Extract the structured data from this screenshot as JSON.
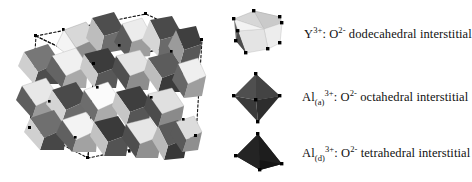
{
  "figure": {
    "background_color": "#ffffff",
    "caption_font_color": "#111111"
  },
  "structure": {
    "name": "garnet-unit-cell-polyhedral-model",
    "description": "Polyhedral model of the garnet unit cell showing interlocking dodecahedra, octahedra and tetrahedra",
    "unit_cell_outline": "dashed",
    "outline_color": "#111111",
    "vertex_marker_color": "#000000",
    "polyhedra_shades": [
      "#ffffff",
      "#e9e9e9",
      "#d2d2d2",
      "#b4b4b4",
      "#949494",
      "#737373",
      "#585858",
      "#3d3d3d"
    ]
  },
  "legend": {
    "items": [
      {
        "icon_name": "dodecahedron-icon",
        "shape": "dodecahedral",
        "cation": "Y",
        "cation_subscript": "",
        "cation_charge": "3+",
        "anion": "O",
        "anion_charge": "2-",
        "separator": ": ",
        "site_text": " dodecahedral interstitial",
        "face_colors": {
          "top_left": "#d5d5d5",
          "top_right": "#c9c9c9",
          "front": "#f2f2f2",
          "front_low": "#e2e2e2",
          "left": "#6e6e6e",
          "left_dark": "#4a4a4a"
        }
      },
      {
        "icon_name": "octahedron-icon",
        "shape": "octahedral",
        "cation": "Al",
        "cation_subscript": "(a)",
        "cation_charge": "3+",
        "anion": "O",
        "anion_charge": "2-",
        "separator": ": ",
        "site_text": " octahedral interstitial",
        "face_colors": {
          "upper_left": "#4f4f4f",
          "upper_right": "#424242",
          "lower_left": "#3a3a3a",
          "lower_right": "#2e2e2e"
        }
      },
      {
        "icon_name": "tetrahedron-icon",
        "shape": "tetrahedral",
        "cation": "Al",
        "cation_subscript": "(d)",
        "cation_charge": "3+",
        "anion": "O",
        "anion_charge": "2-",
        "separator": ": ",
        "site_text": " tetrahedral interstitial",
        "face_colors": {
          "left": "#2b2b2b",
          "right": "#1e1e1e",
          "bottom": "#141414"
        }
      }
    ]
  }
}
